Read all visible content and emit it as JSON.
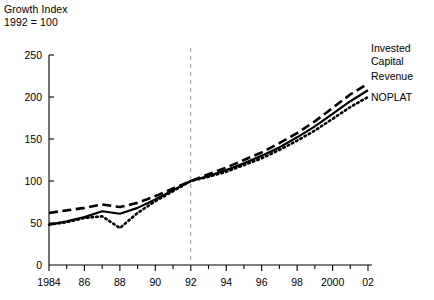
{
  "chart_data": {
    "type": "line",
    "title_line1": "Growth Index",
    "title_line2": "1992 = 100",
    "xlabel": "",
    "ylabel": "",
    "grid": false,
    "legend_position": "right-inline",
    "xlim": [
      1984,
      2002
    ],
    "ylim": [
      0,
      250
    ],
    "yticks": [
      0,
      50,
      100,
      150,
      200,
      250
    ],
    "ytick_labels": [
      "0",
      "50",
      "100",
      "150",
      "200",
      "250"
    ],
    "x": [
      1984,
      1985,
      1986,
      1987,
      1988,
      1989,
      1990,
      1991,
      1992,
      1993,
      1994,
      1995,
      1996,
      1997,
      1998,
      1999,
      2000,
      2001,
      2002
    ],
    "xticks": [
      1984,
      1986,
      1988,
      1990,
      1992,
      1994,
      1996,
      1998,
      2000,
      2002
    ],
    "xtick_labels": [
      "1984",
      "86",
      "88",
      "90",
      "92",
      "94",
      "96",
      "98",
      "2000",
      "02"
    ],
    "xminor_ticks": [
      1985,
      1987,
      1989,
      1991,
      1993,
      1995,
      1997,
      1999,
      2001
    ],
    "annotations": [
      {
        "name": "reference-line",
        "type": "vline",
        "x": 1992,
        "style": "dashed",
        "color": "#9a9a9a",
        "label": ""
      }
    ],
    "series": [
      {
        "name": "Invested Capital",
        "style": "dashed",
        "color": "#000000",
        "values": [
          62,
          65,
          68,
          72,
          69,
          74,
          82,
          91,
          100,
          108,
          116,
          125,
          134,
          145,
          157,
          171,
          187,
          203,
          216
        ]
      },
      {
        "name": "Revenue",
        "style": "solid",
        "color": "#000000",
        "values": [
          48,
          52,
          57,
          64,
          61,
          68,
          78,
          89,
          100,
          106,
          113,
          121,
          130,
          140,
          152,
          165,
          180,
          195,
          208
        ]
      },
      {
        "name": "NOPLAT",
        "style": "dotted",
        "color": "#000000",
        "values": [
          48,
          51,
          56,
          58,
          44,
          62,
          76,
          88,
          100,
          105,
          111,
          119,
          127,
          137,
          148,
          160,
          174,
          188,
          200
        ]
      }
    ]
  },
  "series_labels": {
    "invested_capital_line1": "Invested",
    "invested_capital_line2": "Capital",
    "revenue": "Revenue",
    "noplat": "NOPLAT"
  }
}
